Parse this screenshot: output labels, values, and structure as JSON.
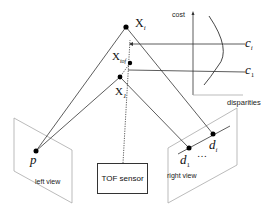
{
  "diagram": {
    "points": {
      "x_i": {
        "label": "X",
        "sub": "i"
      },
      "x_tof": {
        "label": "X",
        "sub": "tof"
      },
      "x_1": {
        "label": "X",
        "sub": "1"
      },
      "p": {
        "label": "p"
      },
      "d_1": {
        "label": "d",
        "sub": "1"
      },
      "d_i": {
        "label": "d",
        "sub": "i"
      },
      "ellipsis": "…"
    },
    "views": {
      "left": "left view",
      "right": "right view"
    },
    "sensor": "TOF sensor",
    "cost_plot": {
      "y_axis_label": "cost",
      "x_axis_label": "disparities",
      "c_i": {
        "label": "c",
        "sub": "i"
      },
      "c_1": {
        "label": "c",
        "sub": "1"
      }
    }
  },
  "colors": {
    "line": "#333333",
    "plane": "#aaaaaa",
    "point": "#000000"
  }
}
